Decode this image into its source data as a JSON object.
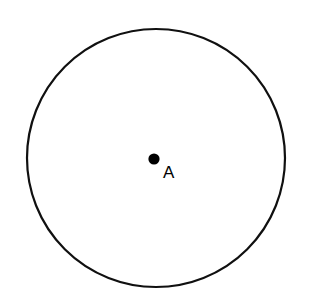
{
  "figure": {
    "type": "geometry-diagram",
    "canvas": {
      "width": 315,
      "height": 289,
      "background_color": "#ffffff"
    },
    "shapes": {
      "circle": {
        "name": "circle-outline",
        "center_x": 156,
        "center_y": 158,
        "radius": 129,
        "stroke_color": "#101010",
        "stroke_width": 2.2,
        "fill": "none",
        "clipped_edge": "bottom"
      },
      "center_point": {
        "name": "center-dot",
        "cx": 154,
        "cy": 159,
        "r": 5.6,
        "fill_color": "#000000"
      }
    },
    "labels": {
      "point_a": {
        "text": "A",
        "x": 163,
        "y": 178,
        "font_size": 17,
        "color": "#000000"
      }
    }
  }
}
